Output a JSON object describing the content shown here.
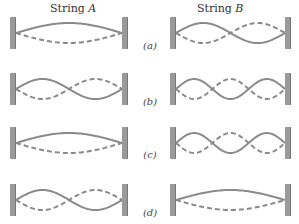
{
  "columns": [
    {
      "id": "A",
      "title_prefix": "String ",
      "title_var": "A"
    },
    {
      "id": "B",
      "title_prefix": "String ",
      "title_var": "B"
    }
  ],
  "rows": [
    {
      "label": "(a)",
      "string_A_loops": 1,
      "string_B_loops": 2
    },
    {
      "label": "(b)",
      "string_A_loops": 2,
      "string_B_loops": 3
    },
    {
      "label": "(c)",
      "string_A_loops": 1,
      "string_B_loops": 3
    },
    {
      "label": "(d)",
      "string_A_loops": 2,
      "string_B_loops": 1
    }
  ],
  "legend": {
    "solid_line": "string displacement (one extreme)",
    "dashed_line": "string displacement (opposite extreme)"
  },
  "colors": {
    "wall": "#9a9a9a",
    "wall_edge": "#6f6f6f",
    "string_solid": "#8a8a8a",
    "string_dashed": "#8a8a8a"
  }
}
